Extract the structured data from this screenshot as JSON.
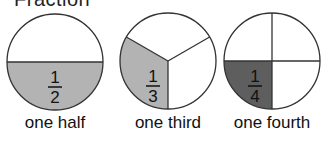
{
  "title": "Fraction",
  "colors": {
    "outline": "#333333",
    "light_fill": "#b3b3b3",
    "dark_fill": "#5e5e5e",
    "background": "#ffffff"
  },
  "circles": [
    {
      "name": "half",
      "numerator": "1",
      "denominator": "2",
      "label": "one half",
      "parts": 2,
      "shaded": 1
    },
    {
      "name": "third",
      "numerator": "1",
      "denominator": "3",
      "label": "one third",
      "parts": 3,
      "shaded": 1
    },
    {
      "name": "fourth",
      "numerator": "1",
      "denominator": "4",
      "label": "one fourth",
      "parts": 4,
      "shaded": 1
    }
  ]
}
